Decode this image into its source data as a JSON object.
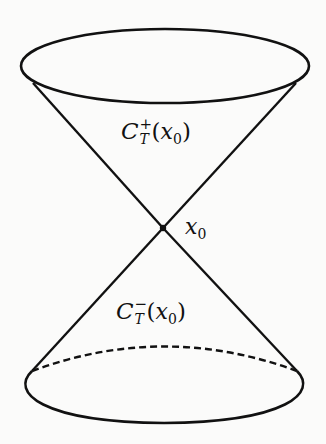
{
  "figure": {
    "type": "light-cone-diagram",
    "stroke_color": "#111111",
    "background_color": "#fbfbfa",
    "apex": {
      "x": 163,
      "y": 228
    },
    "upper_ellipse": {
      "cx": 165,
      "cy": 66,
      "rx": 144,
      "ry": 37,
      "style": "solid"
    },
    "lower_ellipse": {
      "cx": 164,
      "cy": 386,
      "rx": 144,
      "ry": 37,
      "front_style": "solid",
      "back_style": "dashed"
    },
    "labels": {
      "future_cone": {
        "symbol": "C",
        "superscript": "+",
        "subscript": "T",
        "open": "(",
        "var": "x",
        "var_sub": "0",
        "close": ")"
      },
      "past_cone": {
        "symbol": "C",
        "superscript": "−",
        "subscript": "T",
        "open": "(",
        "var": "x",
        "var_sub": "0",
        "close": ")"
      },
      "apex_point": {
        "var": "x",
        "var_sub": "0"
      }
    }
  }
}
